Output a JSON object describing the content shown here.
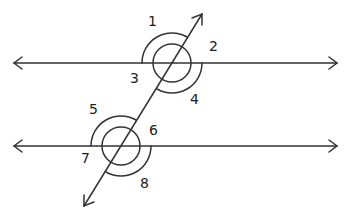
{
  "diagram": {
    "lines": {
      "top_line": {
        "y": 63,
        "x1": 14,
        "x2": 337
      },
      "bottom_line": {
        "y": 146,
        "x1": 14,
        "x2": 337
      },
      "transversal": {
        "x1": 84,
        "y1": 206,
        "x2": 202,
        "y2": 14
      }
    },
    "angle_labels": [
      {
        "id": "1",
        "text": "1",
        "x": 148,
        "y": 26
      },
      {
        "id": "2",
        "text": "2",
        "x": 209,
        "y": 51
      },
      {
        "id": "3",
        "text": "3",
        "x": 130,
        "y": 83
      },
      {
        "id": "4",
        "text": "4",
        "x": 190,
        "y": 104
      },
      {
        "id": "5",
        "text": "5",
        "x": 89,
        "y": 114
      },
      {
        "id": "6",
        "text": "6",
        "x": 149,
        "y": 135
      },
      {
        "id": "7",
        "text": "7",
        "x": 81,
        "y": 163
      },
      {
        "id": "8",
        "text": "8",
        "x": 140,
        "y": 188
      }
    ],
    "colors": {
      "stroke": "#333333",
      "background": "#ffffff"
    }
  }
}
